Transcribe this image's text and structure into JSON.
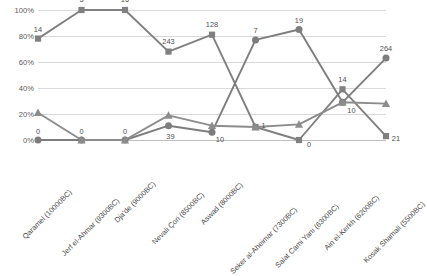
{
  "chart_data": {
    "type": "line",
    "title": "",
    "xlabel": "",
    "ylabel": "",
    "ylim": [
      0,
      100
    ],
    "ytick_labels": [
      "100%",
      "80%",
      "60%",
      "40%",
      "20%",
      "0%"
    ],
    "ytick_values": [
      100,
      80,
      60,
      40,
      20,
      0
    ],
    "grid": true,
    "legend": "none",
    "categories": [
      "Qaramel (10000BC)",
      "Jerf el-Ahmar (9300BC)",
      "Dja'de (9000BC)",
      "Nevali Çori (8500BC)",
      "Aswad (8000BC)",
      "Seker al-Aheimar (7300BC)",
      "Salat Cami Yanı (6300BC)",
      "Ain el-Kerkh (6200BC)",
      "Kosak Shamali (5500BC)"
    ],
    "series": [
      {
        "name": "series-square",
        "marker": "square",
        "color": "#808080",
        "values": [
          78,
          100,
          100,
          68,
          81,
          10,
          0,
          39,
          3
        ],
        "point_labels": [
          "14",
          "5",
          "16",
          "243",
          "128",
          "1",
          "0",
          "14",
          "21"
        ]
      },
      {
        "name": "series-circle",
        "marker": "circle",
        "color": "#7d7d7d",
        "values": [
          0,
          0,
          0,
          11,
          6,
          77,
          85,
          29,
          63
        ],
        "point_labels": [
          "0",
          "0",
          "0",
          "39",
          "10",
          "7",
          "19",
          "10",
          "264"
        ]
      },
      {
        "name": "series-triangle",
        "marker": "triangle",
        "color": "#8c8c8c",
        "values": [
          21,
          0,
          0,
          19,
          11,
          10,
          12,
          29,
          28
        ],
        "point_labels": [
          "",
          "",
          "",
          "",
          "",
          "",
          "",
          "",
          ""
        ]
      }
    ],
    "label_offsets": {
      "square": [
        [
          0,
          -10
        ],
        [
          0,
          -11
        ],
        [
          0,
          -11
        ],
        [
          0,
          -11
        ],
        [
          0,
          -11
        ],
        [
          8,
          -2
        ],
        [
          10,
          4
        ],
        [
          0,
          -10
        ],
        [
          10,
          2
        ]
      ],
      "circle": [
        [
          0,
          -9
        ],
        [
          0,
          -9
        ],
        [
          0,
          -9
        ],
        [
          2,
          10
        ],
        [
          8,
          7
        ],
        [
          0,
          -10
        ],
        [
          0,
          -10
        ],
        [
          9,
          8
        ],
        [
          0,
          -10
        ]
      ],
      "triangle": [
        [
          0,
          0
        ],
        [
          0,
          0
        ],
        [
          0,
          0
        ],
        [
          0,
          0
        ],
        [
          0,
          0
        ],
        [
          0,
          0
        ],
        [
          0,
          0
        ],
        [
          0,
          0
        ],
        [
          0,
          0
        ]
      ]
    }
  },
  "colors": {
    "grid": "#d9d9d9",
    "axis": "#bfbfbf",
    "tick_text": "#5a5a5a",
    "label_text": "#4f4f4f",
    "category_text": "#4a4a4a"
  },
  "footer": {
    "caption": ""
  }
}
